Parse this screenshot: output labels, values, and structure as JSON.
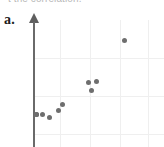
{
  "figure": {
    "clipped_heading_text": "t the correlation.",
    "part_label": "a."
  },
  "chart_data": {
    "type": "scatter",
    "title": "",
    "xlabel": "",
    "ylabel": "",
    "xlim": [
      0,
      10
    ],
    "ylim": [
      0,
      10
    ],
    "grid": true,
    "legend": "none",
    "axes_shown": [
      "y-axis"
    ],
    "axis_arrow": "up",
    "marker_color": "#6e6e6e",
    "marker_size_px": 5,
    "point_count": 10,
    "relationship": "positive",
    "points": [
      {
        "x": 0.3,
        "y": 1.3,
        "px": 36,
        "py": 114
      },
      {
        "x": 0.9,
        "y": 1.3,
        "px": 42,
        "py": 114
      },
      {
        "x": 1.6,
        "y": 1.0,
        "px": 49,
        "py": 117
      },
      {
        "x": 2.4,
        "y": 1.8,
        "px": 58,
        "py": 110
      },
      {
        "x": 2.8,
        "y": 2.5,
        "px": 62,
        "py": 104
      },
      {
        "x": 5.5,
        "y": 5.2,
        "px": 88,
        "py": 82
      },
      {
        "x": 6.3,
        "y": 5.3,
        "px": 96,
        "py": 81
      },
      {
        "x": 5.8,
        "y": 4.4,
        "px": 91,
        "py": 90
      },
      {
        "x": 9.1,
        "y": 8.6,
        "px": 124,
        "py": 40
      },
      {
        "x": 0.3,
        "y": 1.3,
        "px": 36,
        "py": 114
      }
    ],
    "gridlines": {
      "vertical_px": [
        60,
        90,
        120,
        148
      ],
      "horizontal_px": [
        58,
        96,
        134
      ]
    }
  }
}
